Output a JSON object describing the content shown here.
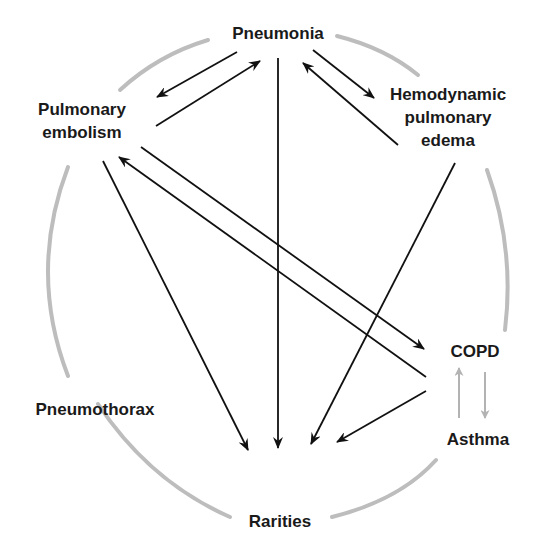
{
  "diagram": {
    "title": "",
    "colors": {
      "arrow": "#111111",
      "secondary_arrow": "#b3b3b3",
      "circle": "#bdbdbd",
      "text": "#1a1a1a"
    },
    "nodes": {
      "pneumonia": {
        "lines": [
          "Pneumonia"
        ]
      },
      "pulmonary_embolism": {
        "lines": [
          "Pulmonary",
          "embolism"
        ]
      },
      "hemodynamic_pulmonary_edema": {
        "lines": [
          "Hemodynamic",
          "pulmonary",
          "edema"
        ]
      },
      "copd": {
        "lines": [
          "COPD"
        ]
      },
      "asthma": {
        "lines": [
          "Asthma"
        ]
      },
      "pneumothorax": {
        "lines": [
          "Pneumothorax"
        ]
      },
      "rarities": {
        "lines": [
          "Rarities"
        ]
      }
    },
    "edges": [
      {
        "from": "Pneumonia",
        "to": "Pulmonary embolism",
        "style": "black"
      },
      {
        "from": "Pulmonary embolism",
        "to": "Pneumonia",
        "style": "black"
      },
      {
        "from": "Pneumonia",
        "to": "Hemodynamic pulmonary edema",
        "style": "black"
      },
      {
        "from": "Hemodynamic pulmonary edema",
        "to": "Pneumonia",
        "style": "black"
      },
      {
        "from": "Pneumonia",
        "to": "Rarities",
        "style": "black"
      },
      {
        "from": "Pulmonary embolism",
        "to": "COPD",
        "style": "black"
      },
      {
        "from": "Asthma",
        "to": "Pulmonary embolism",
        "style": "black"
      },
      {
        "from": "Pulmonary embolism",
        "to": "Rarities",
        "style": "black"
      },
      {
        "from": "Hemodynamic pulmonary edema",
        "to": "Rarities",
        "style": "black"
      },
      {
        "from": "Asthma",
        "to": "Rarities",
        "style": "black"
      },
      {
        "from": "Asthma",
        "to": "COPD",
        "style": "gray"
      },
      {
        "from": "COPD",
        "to": "Asthma",
        "style": "gray"
      }
    ]
  }
}
